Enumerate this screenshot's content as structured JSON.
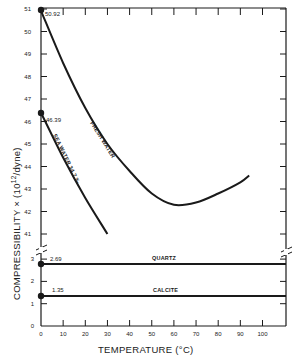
{
  "chart_data": {
    "type": "line",
    "title": "",
    "xlabel": "TEMPERATURE (°C)",
    "ylabel": "COMPRESSIBILITY × (10",
    "ylabel_exponent": "12",
    "ylabel_suffix": "/dyne)",
    "xlim": [
      0,
      110
    ],
    "x_ticks": [
      0,
      10,
      20,
      30,
      40,
      50,
      60,
      70,
      80,
      90,
      100
    ],
    "y_ticks_upper": [
      41,
      42,
      43,
      44,
      45,
      46,
      47,
      48,
      49,
      50,
      51
    ],
    "y_ticks_lower": [
      0,
      1,
      2,
      3
    ],
    "y_axis_break": "between 3 and 41",
    "grid": false,
    "series": [
      {
        "name": "FRESH WATER",
        "x": [
          0,
          10,
          20,
          30,
          40,
          50,
          60,
          70,
          80,
          90,
          94
        ],
        "values": [
          50.92,
          48.6,
          46.6,
          45.0,
          43.8,
          42.8,
          42.3,
          42.4,
          42.8,
          43.3,
          43.6
        ]
      },
      {
        "name": "SEA WATER 34.7 ‰",
        "x": [
          0,
          10,
          20,
          30
        ],
        "values": [
          46.39,
          44.4,
          42.6,
          41.0
        ]
      },
      {
        "name": "QUARTZ",
        "x": [
          0,
          110
        ],
        "values": [
          2.69,
          2.69
        ]
      },
      {
        "name": "CALCITE",
        "x": [
          0,
          110
        ],
        "values": [
          1.35,
          1.35
        ]
      }
    ],
    "annotations": [
      {
        "text": "50.92",
        "x": 0,
        "y": 50.92
      },
      {
        "text": "46.39",
        "x": 0,
        "y": 46.39
      },
      {
        "text": "2.69",
        "x": 0,
        "y": 2.69
      },
      {
        "text": "1.35",
        "x": 0,
        "y": 1.35
      }
    ]
  },
  "labels": {
    "xlabel": "TEMPERATURE (°C)",
    "ylabel_main": "COMPRESSIBILITY × (10",
    "ylabel_exp": "12",
    "ylabel_tail": "/dyne)",
    "fresh_water": "FRESH WATER",
    "sea_water": "SEA WATER 34.7 ‰",
    "quartz": "QUARTZ",
    "calcite": "CALCITE",
    "pt_fresh": "50.92",
    "pt_sea": "46.39",
    "pt_quartz": "2.69",
    "pt_calcite": "1.35"
  },
  "colors": {
    "ink": "#1a1a1a",
    "background": "#ffffff"
  }
}
